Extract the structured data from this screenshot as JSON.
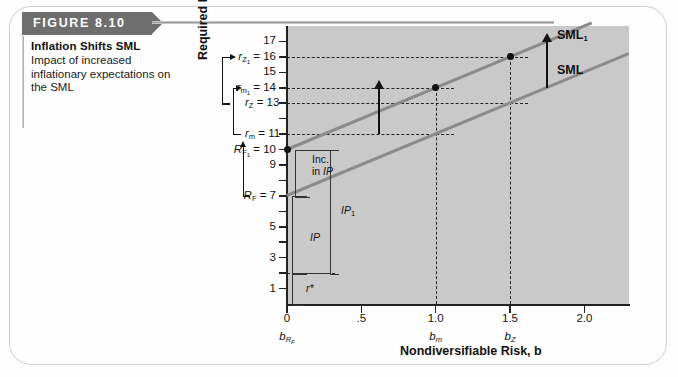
{
  "figure": {
    "number_label": "FIGURE 8.10",
    "title": "Inflation Shifts SML",
    "description": "Impact of increased inflationary expectations on the SML"
  },
  "chart_data": {
    "type": "line",
    "title": "Inflation Shifts SML",
    "xlabel": "Nondiversifiable Risk, b",
    "ylabel": "Required Return, r (%)",
    "xlim": [
      0,
      2.3
    ],
    "ylim": [
      0,
      18
    ],
    "grid": "dashed-guides",
    "x_ticks": [
      "0",
      ".5",
      "1.0",
      "1.5",
      "2.0"
    ],
    "x_tick_values": [
      0,
      0.5,
      1.0,
      1.5,
      2.0
    ],
    "x_tick_sublabels": [
      "b_RF",
      "",
      "b_m",
      "b_Z",
      ""
    ],
    "y_ticks": [
      "1",
      "3",
      "5",
      "7",
      "9",
      "10",
      "11",
      "13",
      "14",
      "15",
      "16",
      "17"
    ],
    "y_tick_values": [
      1,
      3,
      5,
      7,
      9,
      10,
      11,
      13,
      14,
      15,
      16,
      17
    ],
    "series": [
      {
        "name": "SML",
        "label": "SML",
        "intercept": 7,
        "slope": 4,
        "points": [
          {
            "x": 0,
            "y": 7
          },
          {
            "x": 2.3,
            "y": 16.2
          }
        ],
        "color": "#8a8a8a"
      },
      {
        "name": "SML1",
        "label": "SML",
        "label_sub": "1",
        "intercept": 10,
        "slope": 4,
        "points": [
          {
            "x": 0,
            "y": 10
          },
          {
            "x": 2.05,
            "y": 18.2
          }
        ],
        "color": "#8a8a8a"
      }
    ],
    "markers": [
      {
        "label": "R_F1",
        "x": 0,
        "y": 10
      },
      {
        "label": "r_m1",
        "x": 1.0,
        "y": 14
      },
      {
        "label": "r_Z1",
        "x": 1.5,
        "y": 16
      }
    ],
    "shift_arrows": [
      {
        "x": 0.62,
        "from": 11,
        "to": 14
      },
      {
        "x": 1.75,
        "from": 14,
        "to": 17
      }
    ],
    "annotations": {
      "r_star": "r*",
      "IP": "IP",
      "IP1_base": "IP",
      "IP1_sub": "1",
      "inc_in_IP_line1": "Inc.",
      "inc_in_IP_line2": "in IP"
    }
  },
  "y_axis_callouts": [
    {
      "id": "rZ1",
      "base": "r",
      "sub": "Z",
      "subsub": "1",
      "eq": " = 16",
      "value": 16
    },
    {
      "id": "rm1",
      "base": "r",
      "sub": "m",
      "subsub": "1",
      "eq": " = 14",
      "value": 14
    },
    {
      "id": "rZ",
      "base": "r",
      "sub": "Z",
      "subsub": "",
      "eq": " = 13",
      "value": 13
    },
    {
      "id": "rm",
      "base": "r",
      "sub": "m",
      "subsub": "",
      "eq": " = 11",
      "value": 11
    },
    {
      "id": "RF1",
      "base": "R",
      "sub": "F",
      "subsub": "1",
      "eq": " = 10",
      "value": 10
    },
    {
      "id": "RF",
      "base": "R",
      "sub": "F",
      "subsub": "",
      "eq": " = 7",
      "value": 7
    }
  ],
  "plain_y_labels": [
    {
      "text": "17",
      "value": 17
    },
    {
      "text": "15",
      "value": 15
    },
    {
      "text": "9",
      "value": 9
    },
    {
      "text": "5",
      "value": 5
    },
    {
      "text": "3",
      "value": 3
    },
    {
      "text": "1",
      "value": 1
    }
  ],
  "colors": {
    "header_band": "#6e6e6e",
    "plot_background": "#c9c9c9",
    "sml_line": "#8a8a8a",
    "axis": "#222222",
    "frame_border": "#cfcfcf"
  }
}
